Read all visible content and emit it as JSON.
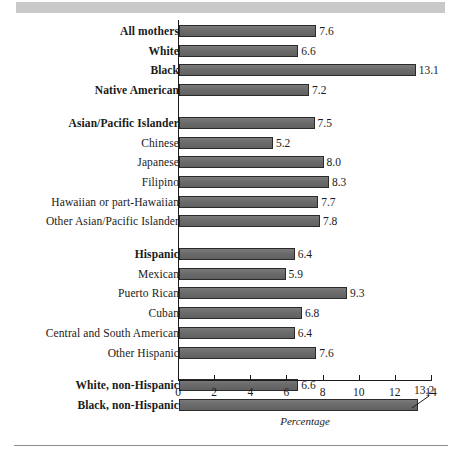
{
  "chart_data": {
    "type": "bar",
    "orientation": "horizontal",
    "title": "",
    "xlabel": "Percentage",
    "ylabel": "",
    "xlim": [
      0,
      14
    ],
    "xticks": [
      0,
      2,
      4,
      6,
      8,
      10,
      12,
      14
    ],
    "xtick_labels": [
      "0",
      "2",
      "4",
      "6",
      "8",
      "10",
      "12",
      "14"
    ],
    "grid": false,
    "legend": null,
    "categories": [
      "All mothers",
      "White",
      "Black",
      "Native American",
      "Asian/Pacific Islander",
      "Chinese",
      "Japanese",
      "Filipino",
      "Hawaiian or part-Hawaiian",
      "Other Asian/Pacific Islander",
      "Hispanic",
      "Mexican",
      "Puerto Rican",
      "Cuban",
      "Central and South American",
      "Other Hispanic",
      "White, non-Hispanic",
      "Black, non-Hispanic"
    ],
    "values": [
      7.6,
      6.6,
      13.1,
      7.2,
      7.5,
      5.2,
      8.0,
      8.3,
      7.7,
      7.8,
      6.4,
      5.9,
      9.3,
      6.8,
      6.4,
      7.6,
      6.6,
      13.2
    ]
  },
  "rows": [
    {
      "label": "All mothers",
      "footnote": "",
      "bold": true,
      "value": 7.6,
      "value_label": "7.6",
      "group": 0,
      "callout": false
    },
    {
      "label": "White",
      "footnote": "",
      "bold": true,
      "value": 6.6,
      "value_label": "6.6",
      "group": 0,
      "callout": false
    },
    {
      "label": "Black",
      "footnote": "",
      "bold": true,
      "value": 13.1,
      "value_label": "13.1",
      "group": 0,
      "callout": false
    },
    {
      "label": "Native American",
      "footnote": "1",
      "bold": true,
      "value": 7.2,
      "value_label": "7.2",
      "group": 0,
      "callout": false
    },
    {
      "label": "Asian/Pacific Islander",
      "footnote": "",
      "bold": true,
      "value": 7.5,
      "value_label": "7.5",
      "group": 1,
      "callout": false
    },
    {
      "label": "Chinese",
      "footnote": "",
      "bold": false,
      "value": 5.2,
      "value_label": "5.2",
      "group": 1,
      "callout": false
    },
    {
      "label": "Japanese",
      "footnote": "",
      "bold": false,
      "value": 8.0,
      "value_label": "8.0",
      "group": 1,
      "callout": false
    },
    {
      "label": "Filipino",
      "footnote": "",
      "bold": false,
      "value": 8.3,
      "value_label": "8.3",
      "group": 1,
      "callout": false
    },
    {
      "label": "Hawaiian or part-Hawaiian",
      "footnote": "",
      "bold": false,
      "value": 7.7,
      "value_label": "7.7",
      "group": 1,
      "callout": false
    },
    {
      "label": "Other Asian/Pacific Islander",
      "footnote": "",
      "bold": false,
      "value": 7.8,
      "value_label": "7.8",
      "group": 1,
      "callout": false
    },
    {
      "label": "Hispanic",
      "footnote": "2",
      "bold": true,
      "value": 6.4,
      "value_label": "6.4",
      "group": 2,
      "callout": false
    },
    {
      "label": "Mexican",
      "footnote": "",
      "bold": false,
      "value": 5.9,
      "value_label": "5.9",
      "group": 2,
      "callout": false
    },
    {
      "label": "Puerto Rican",
      "footnote": "",
      "bold": false,
      "value": 9.3,
      "value_label": "9.3",
      "group": 2,
      "callout": false
    },
    {
      "label": "Cuban",
      "footnote": "",
      "bold": false,
      "value": 6.8,
      "value_label": "6.8",
      "group": 2,
      "callout": false
    },
    {
      "label": "Central and South American",
      "footnote": "",
      "bold": false,
      "value": 6.4,
      "value_label": "6.4",
      "group": 2,
      "callout": false
    },
    {
      "label": "Other Hispanic",
      "footnote": "",
      "bold": false,
      "value": 7.6,
      "value_label": "7.6",
      "group": 2,
      "callout": false
    },
    {
      "label": "White, non-Hispanic",
      "footnote": "",
      "bold": true,
      "value": 6.6,
      "value_label": "6.6",
      "group": 3,
      "callout": false
    },
    {
      "label": "Black, non-Hispanic",
      "footnote": "",
      "bold": true,
      "value": 13.2,
      "value_label": "13.2",
      "group": 3,
      "callout": true
    }
  ],
  "axis": {
    "title": "Percentage",
    "ticks": [
      "0",
      "2",
      "4",
      "6",
      "8",
      "10",
      "12",
      "14"
    ],
    "min": 0,
    "max": 14
  },
  "style": {
    "bar_fill": "#6e6e6e",
    "bar_stroke": "#2a2a2a",
    "axis_color": "#1a1a1a",
    "band_color": "#c9c9c9",
    "rule_color": "#8e8e8e",
    "text_color": "#1a1a1a"
  }
}
